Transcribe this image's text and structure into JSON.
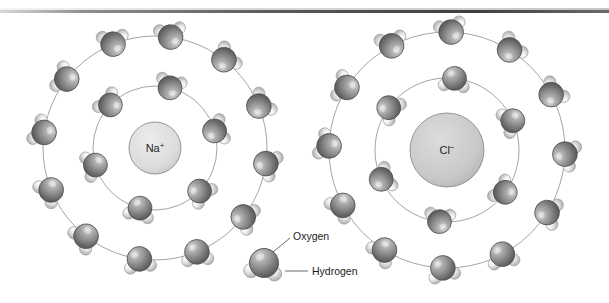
{
  "figure": {
    "title_visible": false,
    "background_color": "#ffffff",
    "top_rule_color": "#4a4a4a"
  },
  "ions": [
    {
      "id": "sodium",
      "symbol": "Na",
      "charge": "+",
      "charge_sign": "positive",
      "center": {
        "x": 155,
        "y": 148
      },
      "radius": 26,
      "fill": "#dcdcdc",
      "stroke": "#8c8c8c",
      "inner_shell_count": 6,
      "outer_shell_count": 12,
      "inner_ring_radius": 62,
      "outer_ring_radius": 112,
      "inner_orientation": "hydrogens-outward"
    },
    {
      "id": "chloride",
      "symbol": "Cl",
      "charge": "−",
      "charge_sign": "negative",
      "center": {
        "x": 447,
        "y": 150
      },
      "radius": 37,
      "fill": "#c9c9c9",
      "stroke": "#8c8c8c",
      "inner_shell_count": 6,
      "outer_shell_count": 12,
      "inner_ring_radius": 72,
      "outer_ring_radius": 118,
      "inner_orientation": "hydrogens-inward"
    }
  ],
  "legend": {
    "molecule_center": {
      "x": 264,
      "y": 263
    },
    "items": [
      {
        "id": "oxygen",
        "label": "Oxygen",
        "color": "#8a8a8a",
        "role": "large-sphere"
      },
      {
        "id": "hydrogen",
        "label": "Hydrogen",
        "color": "#e2e2e2",
        "role": "small-sphere"
      }
    ]
  },
  "colors": {
    "oxygen_base": "#8e8e8e",
    "oxygen_light": "#d5d5d5",
    "oxygen_dark": "#5d5d5d",
    "hydrogen_base": "#e8e8e8",
    "hydrogen_light": "#fbfbfb",
    "hydrogen_dark": "#a8a8a8",
    "ring_line": "#9a9a9a",
    "leader_line": "#5a5a5a"
  },
  "chart_data": {
    "type": "diagram",
    "annotations": [
      "Na+",
      "Cl−",
      "Oxygen",
      "Hydrogen"
    ]
  }
}
